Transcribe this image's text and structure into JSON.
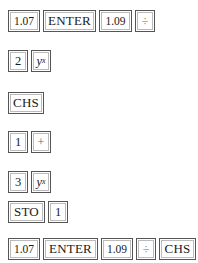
{
  "sequences": [
    {
      "keys": [
        {
          "label": "1.07",
          "type": "number"
        },
        {
          "label": "ENTER",
          "type": "command"
        },
        {
          "label": "1.09",
          "type": "number"
        },
        {
          "label": "÷",
          "type": "operator"
        }
      ]
    },
    {
      "keys": [
        {
          "label": "2",
          "type": "number"
        },
        {
          "label": "y",
          "sup": "x",
          "type": "function"
        }
      ]
    },
    {
      "keys": [
        {
          "label": "CHS",
          "type": "command"
        }
      ]
    },
    {
      "keys": [
        {
          "label": "1",
          "type": "number"
        },
        {
          "label": "+",
          "type": "operator"
        }
      ]
    },
    {
      "keys": [
        {
          "label": "3",
          "type": "number"
        },
        {
          "label": "y",
          "sup": "x",
          "type": "function"
        }
      ]
    },
    {
      "keys": [
        {
          "label": "STO",
          "type": "command"
        },
        {
          "label": "1",
          "type": "number"
        }
      ]
    },
    {
      "keys": [
        {
          "label": "1.07",
          "type": "number"
        },
        {
          "label": "ENTER",
          "type": "command"
        },
        {
          "label": "1.09",
          "type": "number"
        },
        {
          "label": "÷",
          "type": "operator"
        },
        {
          "label": "CHS",
          "type": "command"
        }
      ]
    }
  ]
}
